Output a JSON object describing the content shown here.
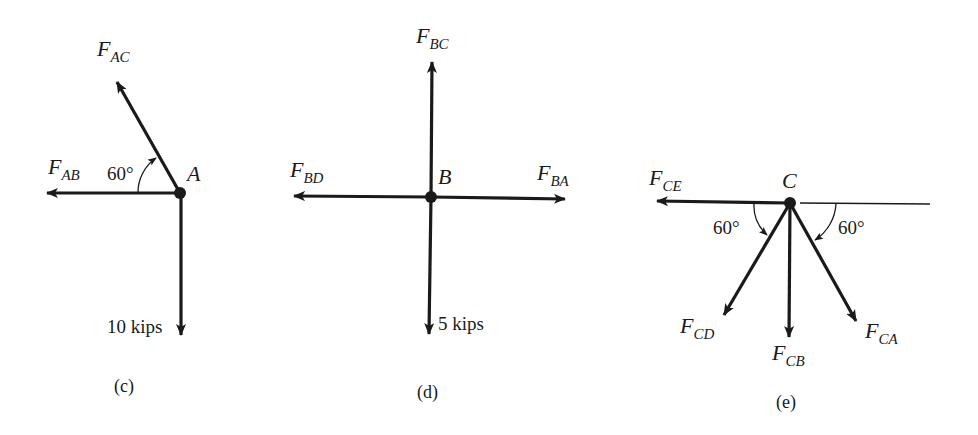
{
  "panels": [
    {
      "caption": "(c)",
      "node": "A",
      "angle_label": "60°",
      "load_label": "10 kips",
      "forces": [
        {
          "main": "F",
          "sub": "AC",
          "direction": "up-left, 60° from horizontal"
        },
        {
          "main": "F",
          "sub": "AB",
          "direction": "left"
        },
        {
          "main": "",
          "sub": "",
          "label": "10 kips",
          "direction": "down"
        }
      ]
    },
    {
      "caption": "(d)",
      "node": "B",
      "load_label": "5 kips",
      "forces": [
        {
          "main": "F",
          "sub": "BC",
          "direction": "up"
        },
        {
          "main": "F",
          "sub": "BD",
          "direction": "left"
        },
        {
          "main": "F",
          "sub": "BA",
          "direction": "right"
        },
        {
          "main": "",
          "sub": "",
          "label": "5 kips",
          "direction": "down"
        }
      ]
    },
    {
      "caption": "(e)",
      "node": "C",
      "angle_left_label": "60°",
      "angle_right_label": "60°",
      "forces": [
        {
          "main": "F",
          "sub": "CE",
          "direction": "left"
        },
        {
          "main": "F",
          "sub": "CD",
          "direction": "down-left, 60° below horizontal"
        },
        {
          "main": "F",
          "sub": "CB",
          "direction": "down"
        },
        {
          "main": "F",
          "sub": "CA",
          "direction": "down-right, 60° below horizontal"
        }
      ]
    }
  ],
  "colors": {
    "ink": "#1a1a1a",
    "background": "#ffffff"
  }
}
